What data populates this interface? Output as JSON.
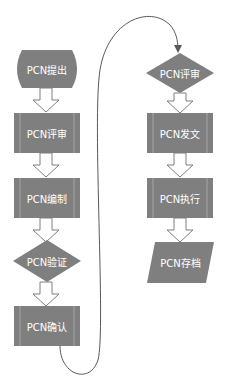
{
  "diagram": {
    "type": "flowchart",
    "colors": {
      "node_fill": "#7f7f7f",
      "node_stripe": "#a6a6a6",
      "node_text": "#ffffff",
      "arrow_fill": "#ffffff",
      "arrow_stroke": "#7f7f7f",
      "connector": "#595959",
      "background": "#ffffff"
    },
    "left_column": [
      {
        "id": "n1",
        "shape": "terminator",
        "label": "PCN提出"
      },
      {
        "id": "n2",
        "shape": "predefined-process",
        "label": "PCN评审"
      },
      {
        "id": "n3",
        "shape": "predefined-process",
        "label": "PCN编制"
      },
      {
        "id": "n4",
        "shape": "decision",
        "label": "PCN验证"
      },
      {
        "id": "n5",
        "shape": "predefined-process",
        "label": "PCN确认"
      }
    ],
    "right_column": [
      {
        "id": "n6",
        "shape": "decision",
        "label": "PCN评审"
      },
      {
        "id": "n7",
        "shape": "predefined-process",
        "label": "PCN发文"
      },
      {
        "id": "n8",
        "shape": "predefined-process",
        "label": "PCN执行"
      },
      {
        "id": "n9",
        "shape": "data",
        "label": "PCN存档"
      }
    ],
    "edges": [
      [
        "n1",
        "n2"
      ],
      [
        "n2",
        "n3"
      ],
      [
        "n3",
        "n4"
      ],
      [
        "n4",
        "n5"
      ],
      [
        "n5",
        "n6"
      ],
      [
        "n6",
        "n7"
      ],
      [
        "n7",
        "n8"
      ],
      [
        "n8",
        "n9"
      ]
    ]
  }
}
